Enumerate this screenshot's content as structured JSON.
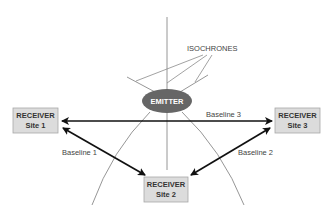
{
  "diagram": {
    "colors": {
      "background": "#ffffff",
      "emitter_fill": "#666666",
      "receiver_fill": "#dcdcdc",
      "receiver_border": "#a8a8a8",
      "baseline_stroke": "#111111",
      "isochrone_stroke": "#8a8a8a"
    },
    "emitter": {
      "label": "EMITTER"
    },
    "isochrones": {
      "label": "ISOCHRONES"
    },
    "receivers": [
      {
        "id": "site1",
        "line1": "RECEIVER",
        "line2": "Site 1"
      },
      {
        "id": "site2",
        "line1": "RECEIVER",
        "line2": "Site 2"
      },
      {
        "id": "site3",
        "line1": "RECEIVER",
        "line2": "Site 3"
      }
    ],
    "baselines": [
      {
        "label": "Baseline 1",
        "from": "Site 1",
        "to": "Site 2"
      },
      {
        "label": "Baseline 2",
        "from": "Site 3",
        "to": "Site 2"
      },
      {
        "label": "Baseline 3",
        "from": "Site 1",
        "to": "Site 3"
      }
    ]
  }
}
